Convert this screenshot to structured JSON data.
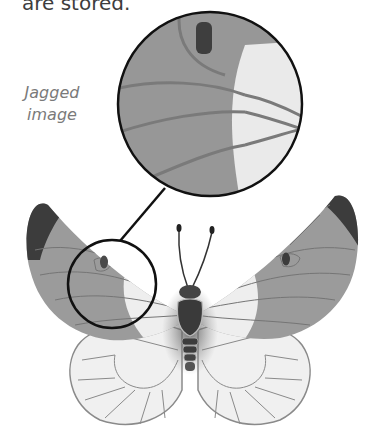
{
  "caption": {
    "text": "are stored."
  },
  "label": {
    "line1": "Jagged",
    "line2": "image"
  },
  "colors": {
    "wing_gray": "#9b9b9b",
    "wing_light": "#eeeeee",
    "wing_tip": "#3c3c3c",
    "vein": "#757575",
    "outline": "#111111",
    "body": "#4a4a4a"
  }
}
